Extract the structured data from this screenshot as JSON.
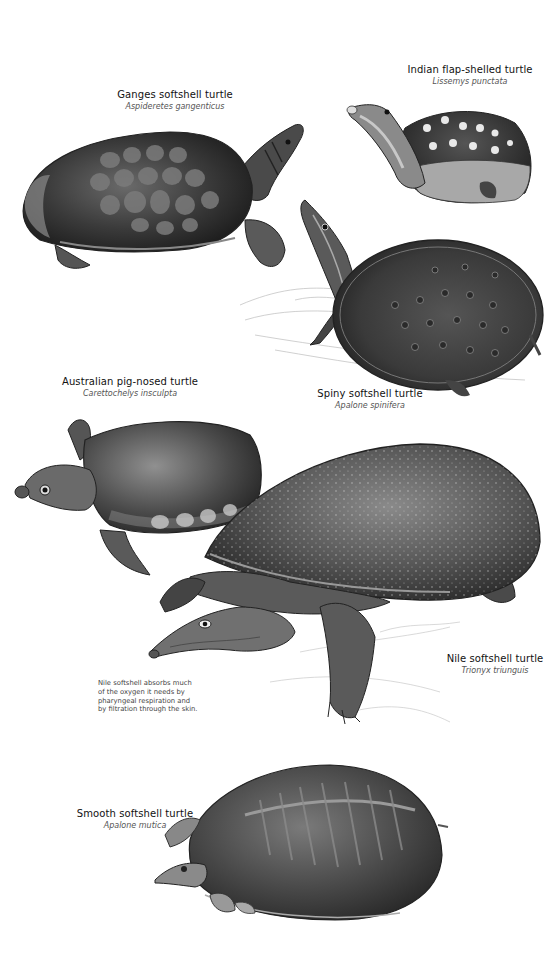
{
  "page": {
    "background": "#ffffff",
    "ink_color": "#1a1a1a",
    "caption_color": "#555555"
  },
  "species": [
    {
      "id": "ganges",
      "common_name": "Ganges softshell turtle",
      "scientific_name": "Aspideretes gangenticus"
    },
    {
      "id": "indian-flap",
      "common_name": "Indian flap-shelled turtle",
      "scientific_name": "Lissemys punctata"
    },
    {
      "id": "spiny",
      "common_name": "Spiny softshell turtle",
      "scientific_name": "Apalone spinifera"
    },
    {
      "id": "pig-nosed",
      "common_name": "Australian pig-nosed turtle",
      "scientific_name": "Carettochelys insculpta"
    },
    {
      "id": "nile",
      "common_name": "Nile softshell turtle",
      "scientific_name": "Trionyx triunguis"
    },
    {
      "id": "smooth",
      "common_name": "Smooth softshell turtle",
      "scientific_name": "Apalone mutica"
    }
  ],
  "annotation": {
    "lines": [
      "Nile softshell absorbs much",
      "of the oxygen it needs by",
      "pharyngeal respiration and",
      "by filtration through the skin."
    ]
  }
}
